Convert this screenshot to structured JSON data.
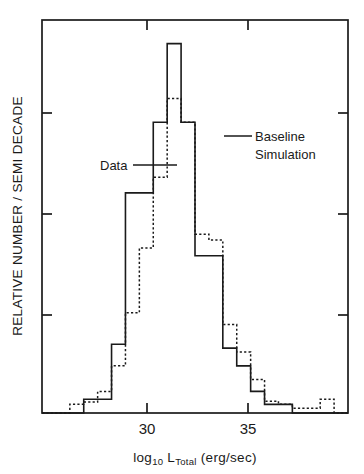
{
  "chart_data": {
    "type": "bar",
    "title": "",
    "xlabel": "log10 L_Total (erg/sec)",
    "xlabel_parts": {
      "log": "log",
      "log_sub": "10",
      "lum": "L",
      "lum_sub": "Total",
      "units": "(erg/sec)"
    },
    "ylabel": "RELATIVE NUMBER / SEMI DECADE",
    "xlim": [
      28.0,
      39.0
    ],
    "ylim": [
      0,
      1.0
    ],
    "bin_width": 0.5,
    "grid": false,
    "legend_position": "inline-annotation",
    "xticks": [
      30,
      35
    ],
    "xtick_labels": [
      "30",
      "35"
    ],
    "ytick_positions": [
      0.25,
      0.5,
      0.75
    ],
    "ytick_labels": [
      "",
      "",
      ""
    ],
    "annotations": [
      {
        "text": "Data",
        "x_px": 100,
        "y_px": 165,
        "leader_to_x_px": 168,
        "leader_to_y_px": 161
      },
      {
        "text_line1": "Baseline",
        "text_line2": "Simulation",
        "x_px": 252,
        "y_px": 140,
        "leader_from_x_px": 222,
        "leader_to_x_px": 249,
        "leader_y_px": 136
      }
    ],
    "series": [
      {
        "name": "Data",
        "style": "solid",
        "bin_edges": [
          28.0,
          28.5,
          29.0,
          29.5,
          30.0,
          30.5,
          31.0,
          31.5,
          32.0,
          32.5,
          33.0,
          33.5,
          34.0,
          34.5,
          35.0,
          35.5,
          36.0,
          36.5,
          37.0,
          37.5,
          38.0,
          38.5,
          39.0
        ],
        "values": [
          0.0,
          0.0,
          0.0,
          0.035,
          0.035,
          0.175,
          0.56,
          0.56,
          0.74,
          0.94,
          0.74,
          0.4,
          0.4,
          0.165,
          0.12,
          0.055,
          0.022,
          0.022,
          0.0,
          0.0,
          0.0,
          0.0
        ]
      },
      {
        "name": "Baseline Simulation",
        "style": "dashed",
        "bin_edges": [
          28.0,
          28.5,
          29.0,
          29.5,
          30.0,
          30.5,
          31.0,
          31.5,
          32.0,
          32.5,
          33.0,
          33.5,
          34.0,
          34.5,
          35.0,
          35.5,
          36.0,
          36.5,
          37.0,
          37.5,
          38.0,
          38.5,
          39.0
        ],
        "values": [
          0.0,
          0.0,
          0.022,
          0.028,
          0.055,
          0.12,
          0.255,
          0.42,
          0.6,
          0.8,
          0.74,
          0.455,
          0.44,
          0.225,
          0.155,
          0.085,
          0.03,
          0.022,
          0.012,
          0.012,
          0.035,
          0.0
        ]
      }
    ]
  },
  "figure": {
    "plot_area_px": {
      "left": 42,
      "right": 348,
      "top": 20,
      "bottom": 413
    }
  }
}
